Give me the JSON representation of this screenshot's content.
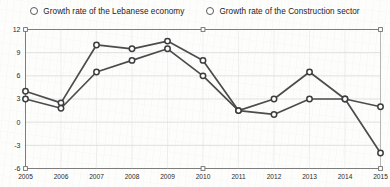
{
  "legend": {
    "position": "top",
    "entries": [
      {
        "label": "Growth rate of the Lebanese economy",
        "marker": "circle-open-icon"
      },
      {
        "label": "Growth rate of the Construction sector",
        "marker": "circle-open-icon"
      }
    ]
  },
  "axes": {
    "y_ticks": [
      "12",
      "9",
      "6",
      "3",
      "0",
      "-3",
      "-6"
    ],
    "x_ticks": [
      "2005",
      "2006",
      "2007",
      "2008",
      "2009",
      "2010",
      "2011",
      "2012",
      "2013",
      "2014",
      "2015"
    ]
  },
  "colors": {
    "series_line": "#4c4c4c",
    "marker_fill": "#ffffff",
    "marker_stroke": "#3d3d3d",
    "grid": "#d6d6d6",
    "axis": "#6e6e6e",
    "background": "#fdfdfc",
    "text": "#1c1c1c"
  },
  "chart_data": {
    "type": "line",
    "title": "",
    "subtitle": "",
    "xlabel": "",
    "ylabel": "",
    "x": [
      2005,
      2006,
      2007,
      2008,
      2009,
      2010,
      2011,
      2012,
      2013,
      2014,
      2015
    ],
    "categories": [
      "2005",
      "2006",
      "2007",
      "2008",
      "2009",
      "2010",
      "2011",
      "2012",
      "2013",
      "2014",
      "2015"
    ],
    "xlim": [
      2005,
      2015
    ],
    "ylim": [
      -6,
      12
    ],
    "ytick_interval": 3,
    "grid": true,
    "legend_position": "top",
    "series": [
      {
        "name": "Growth rate of the Lebanese economy",
        "marker": "circle-open",
        "values": [
          4.0,
          2.5,
          10.0,
          9.5,
          10.5,
          8.0,
          1.5,
          1.0,
          3.0,
          3.0,
          2.0
        ]
      },
      {
        "name": "Growth rate of the Construction sector",
        "marker": "circle-open",
        "values": [
          3.0,
          1.8,
          6.5,
          8.0,
          9.5,
          6.0,
          1.5,
          3.0,
          6.5,
          3.0,
          -4.0
        ]
      }
    ]
  }
}
